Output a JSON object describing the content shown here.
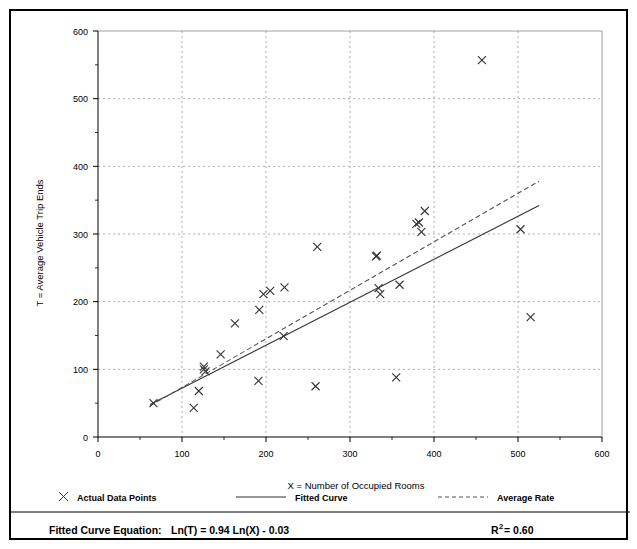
{
  "chart_data": {
    "type": "scatter",
    "title": "",
    "xlabel": "X = Number of Occupied Rooms",
    "ylabel": "T = Average Vehicle Trip Ends",
    "xlim": [
      0,
      600
    ],
    "ylim": [
      0,
      600
    ],
    "xticks": [
      0,
      100,
      200,
      300,
      400,
      500,
      600
    ],
    "yticks": [
      0,
      100,
      200,
      300,
      400,
      500,
      600
    ],
    "xtick_labels": [
      "0",
      "100",
      "200",
      "300",
      "400",
      "500",
      "600"
    ],
    "ytick_labels": [
      "0",
      "100",
      "200",
      "300",
      "400",
      "500",
      "600"
    ],
    "minor_tick_interval": 50,
    "grid": true,
    "grid_style": "dotted",
    "legend_position": "below-axis",
    "series": [
      {
        "name": "Actual Data Points",
        "type": "scatter",
        "marker": "x",
        "points": [
          [
            66,
            50
          ],
          [
            114,
            43
          ],
          [
            120,
            68
          ],
          [
            126,
            100
          ],
          [
            126,
            104
          ],
          [
            128,
            97
          ],
          [
            146,
            122
          ],
          [
            163,
            168
          ],
          [
            191,
            83
          ],
          [
            192,
            188
          ],
          [
            197,
            211
          ],
          [
            205,
            216
          ],
          [
            221,
            149
          ],
          [
            222,
            221
          ],
          [
            259,
            75
          ],
          [
            261,
            281
          ],
          [
            331,
            267
          ],
          [
            332,
            268
          ],
          [
            334,
            220
          ],
          [
            336,
            211
          ],
          [
            355,
            88
          ],
          [
            359,
            225
          ],
          [
            379,
            315
          ],
          [
            382,
            317
          ],
          [
            385,
            303
          ],
          [
            389,
            334
          ],
          [
            457,
            557
          ],
          [
            503,
            307
          ],
          [
            515,
            177
          ]
        ]
      },
      {
        "name": "Fitted Curve",
        "type": "line",
        "style": "solid",
        "equation": "Ln(T) = 0.94 Ln(X) - 0.03",
        "endpoints": [
          [
            62,
            48
          ],
          [
            525,
            342
          ]
        ]
      },
      {
        "name": "Average Rate",
        "type": "line",
        "style": "dashed",
        "endpoints": [
          [
            62,
            46
          ],
          [
            525,
            378
          ]
        ]
      }
    ],
    "annotations": {
      "equation_label": "Fitted Curve Equation:",
      "equation": "Ln(T) = 0.94 Ln(X) - 0.03",
      "r_squared_base": "R",
      "r_squared_exp": "2",
      "r_squared_value": " = 0.60"
    }
  },
  "legend": {
    "entries": [
      {
        "label": "Actual Data Points",
        "marker": "x"
      },
      {
        "label": "Fitted Curve",
        "marker": "solid-line"
      },
      {
        "label": "Average Rate",
        "marker": "dashed-line"
      }
    ]
  },
  "footer": {
    "equation_label": "Fitted Curve Equation:",
    "equation_value": "Ln(T) = 0.94 Ln(X) - 0.03",
    "r_label": "R",
    "r_exponent": "2",
    "r_value": " = 0.60"
  },
  "colors": {
    "axis": "#000000",
    "grid": "#9a9a9a",
    "marker": "#333333",
    "fitted_curve": "#333333",
    "average_rate": "#555555",
    "border": "#000000",
    "background": "#ffffff"
  }
}
